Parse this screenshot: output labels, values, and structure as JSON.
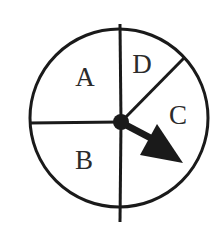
{
  "figure": {
    "name": "spinner-wheel",
    "background_color": "#ffffff",
    "stroke_color": "#1a1a1a",
    "label_color": "#2b2b2b",
    "circle": {
      "cx": 119,
      "cy": 118,
      "r": 89,
      "stroke_width": 3
    },
    "hub": {
      "cx": 121,
      "cy": 122,
      "r": 8,
      "color": "#1a1a1a"
    },
    "spokes": [
      {
        "name": "spoke-up",
        "x1": 121,
        "y1": 122,
        "x2": 120,
        "y2": 24,
        "stroke_width": 3
      },
      {
        "name": "spoke-down",
        "x1": 121,
        "y1": 122,
        "x2": 120,
        "y2": 222,
        "stroke_width": 3
      },
      {
        "name": "spoke-left",
        "x1": 121,
        "y1": 122,
        "x2": 29,
        "y2": 123,
        "stroke_width": 3
      },
      {
        "name": "spoke-diagonal-upper-right",
        "x1": 121,
        "y1": 122,
        "x2": 185,
        "y2": 57,
        "stroke_width": 3
      }
    ],
    "pointer": {
      "name": "spinner-arrow",
      "shaft": {
        "x1": 124,
        "y1": 124,
        "x2": 160,
        "y2": 143,
        "stroke_width": 7
      },
      "head_points": "157,124 183,163 140,155",
      "color": "#1a1a1a",
      "direction": "down-right",
      "points_at": "C"
    },
    "labels": [
      {
        "id": "label-a",
        "text": "A",
        "x": 85,
        "y": 80
      },
      {
        "id": "label-b",
        "text": "B",
        "x": 84,
        "y": 163
      },
      {
        "id": "label-c",
        "text": "C",
        "x": 178,
        "y": 118
      },
      {
        "id": "label-d",
        "text": "D",
        "x": 142,
        "y": 67
      }
    ]
  }
}
